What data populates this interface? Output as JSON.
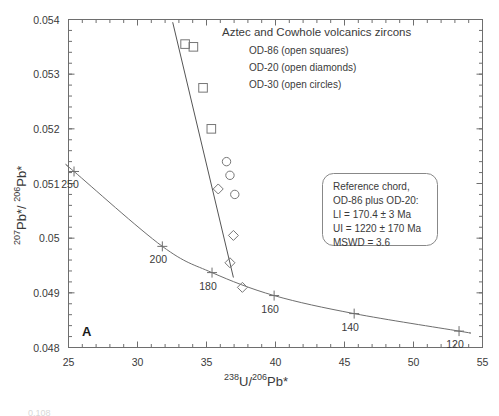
{
  "figure": {
    "panel_label": "A",
    "bottom_edge_artifact": "0.108"
  },
  "chart_data": {
    "type": "scatter",
    "title": "Aztec and Cowhole volcanics zircons",
    "xlabel": "238U/206Pb*",
    "ylabel": "207Pb*/ 206Pb*",
    "xlabel_parts": {
      "sup1": "238",
      "mid": "U/",
      "sup2": "206",
      "tail": "Pb*"
    },
    "ylabel_parts": {
      "sup1": "207",
      "mid": "Pb*/ ",
      "sup2": "206",
      "tail": "Pb*"
    },
    "xlim": [
      25,
      55
    ],
    "ylim": [
      0.048,
      0.054
    ],
    "xticks": [
      25,
      30,
      35,
      40,
      45,
      50,
      55
    ],
    "xtick_labels": [
      "25",
      "30",
      "35",
      "40",
      "45",
      "50",
      "55"
    ],
    "yticks": [
      0.048,
      0.049,
      0.05,
      0.051,
      0.052,
      0.053,
      0.054
    ],
    "ytick_labels": [
      "0.048",
      "0.049",
      "0.05",
      "0.051",
      "0.052",
      "0.053",
      "0.054"
    ],
    "x_minor_step": 1,
    "y_minor_step": 0.0002,
    "grid": false,
    "legend_position": "top-right",
    "legend": [
      {
        "label": "OD-86 (open squares)",
        "marker": "square"
      },
      {
        "label": "OD-20 (open diamonds)",
        "marker": "diamond"
      },
      {
        "label": "OD-30 (open circles)",
        "marker": "circle"
      }
    ],
    "series": [
      {
        "name": "OD-86",
        "marker": "square",
        "points": [
          {
            "x": 33.45,
            "y": 0.05355
          },
          {
            "x": 34.05,
            "y": 0.0535
          },
          {
            "x": 34.75,
            "y": 0.05275
          },
          {
            "x": 35.35,
            "y": 0.052
          }
        ]
      },
      {
        "name": "OD-20",
        "marker": "diamond",
        "points": [
          {
            "x": 35.85,
            "y": 0.0509
          },
          {
            "x": 36.95,
            "y": 0.05005
          },
          {
            "x": 36.7,
            "y": 0.04955
          },
          {
            "x": 37.6,
            "y": 0.0491
          }
        ]
      },
      {
        "name": "OD-30",
        "marker": "circle",
        "points": [
          {
            "x": 36.45,
            "y": 0.0514
          },
          {
            "x": 36.7,
            "y": 0.05115
          },
          {
            "x": 37.05,
            "y": 0.0508
          }
        ]
      }
    ],
    "concordia": {
      "name": "Concordia curve",
      "age_markers": [
        {
          "age": 250,
          "label": "250",
          "x": 25.4,
          "y": 0.05122
        },
        {
          "age": 200,
          "label": "200",
          "x": 31.8,
          "y": 0.04985
        },
        {
          "age": 180,
          "label": "180",
          "x": 35.4,
          "y": 0.04937
        },
        {
          "age": 160,
          "label": "160",
          "x": 39.9,
          "y": 0.04895
        },
        {
          "age": 140,
          "label": "140",
          "x": 45.7,
          "y": 0.04862
        },
        {
          "age": 120,
          "label": "120",
          "x": 53.3,
          "y": 0.0483
        }
      ]
    },
    "discordia": {
      "name": "Reference chord",
      "x_start": 32.55,
      "y_start": 0.05395,
      "x_end": 36.95,
      "y_end": 0.04928
    },
    "annotations": [
      {
        "name": "panel-label",
        "text": "A"
      }
    ]
  },
  "reference_chord_box": {
    "lines": [
      "Reference chord,",
      "OD-86 plus OD-20:",
      "LI = 170.4 ± 3 Ma",
      "UI = 1220 ± 170 Ma",
      "MSWD = 3.6"
    ]
  }
}
